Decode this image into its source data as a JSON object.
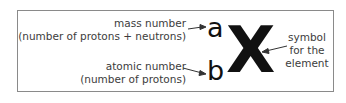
{
  "diagram": {
    "mass_label_1": "mass number",
    "mass_label_2": "(number of protons + neutrons)",
    "atomic_label_1": "atomic number",
    "atomic_label_2": "(number of protons)",
    "mass_symbol": "a",
    "atomic_symbol": "b",
    "element_symbol": "X",
    "symbol_label_1": "symbol",
    "symbol_label_2": "for the",
    "symbol_label_3": "element"
  }
}
